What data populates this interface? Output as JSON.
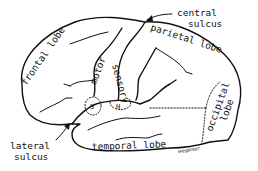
{
  "diagram": {
    "lobes": [
      {
        "id": "frontal",
        "label": "frontal lobe"
      },
      {
        "id": "parietal",
        "label": "parietal lobe"
      },
      {
        "id": "occipital",
        "label": "occipital lobe",
        "lines": [
          "occipital",
          "lobe"
        ]
      },
      {
        "id": "temporal",
        "label": "temporal lobe"
      }
    ],
    "areas": [
      {
        "id": "motor",
        "label": "motor"
      },
      {
        "id": "sensory",
        "label": "sensory"
      },
      {
        "id": "speech",
        "label": "S"
      },
      {
        "id": "hearing",
        "label": "H"
      }
    ],
    "callouts": [
      {
        "id": "central-sulcus",
        "lines": [
          "central",
          "sulcus"
        ]
      },
      {
        "id": "lateral-sulcus",
        "lines": [
          "lateral",
          "sulcus"
        ]
      }
    ],
    "signature": "wegener"
  }
}
